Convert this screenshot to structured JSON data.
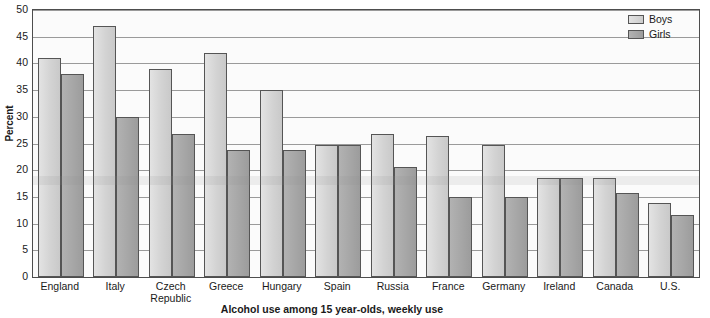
{
  "chart_data": {
    "type": "bar",
    "title": "",
    "xlabel": "Alcohol use among 15 year-olds, weekly use",
    "ylabel": "Percent",
    "ylim": [
      0,
      50
    ],
    "yticks": [
      0,
      5,
      10,
      15,
      20,
      25,
      30,
      35,
      40,
      45,
      50
    ],
    "ytick_labels": [
      "0",
      "5",
      "10",
      "15",
      "20",
      "25",
      "30",
      "35",
      "40",
      "45",
      "50"
    ],
    "grid": true,
    "legend_position": "top-right",
    "categories": [
      "England",
      "Italy",
      "Czech\nRepublic",
      "Greece",
      "Hungary",
      "Spain",
      "Russia",
      "France",
      "Germany",
      "Ireland",
      "Canada",
      "U.S."
    ],
    "series": [
      {
        "name": "Boys",
        "color": "#d6d6d6",
        "values": [
          41,
          47,
          39,
          42,
          35,
          24.7,
          26.7,
          26.5,
          24.7,
          18.6,
          18.6,
          13.8
        ]
      },
      {
        "name": "Girls",
        "color": "#a8a8a8",
        "values": [
          38,
          30,
          26.8,
          23.8,
          23.7,
          24.7,
          20.6,
          15,
          14.9,
          18.6,
          15.8,
          11.7
        ]
      }
    ]
  },
  "legend": {
    "items": [
      {
        "label": "Boys",
        "swatch": "boys"
      },
      {
        "label": "Girls",
        "swatch": "girls"
      }
    ]
  },
  "axes": {
    "y_title": "Percent",
    "x_title": "Alcohol use among 15 year-olds, weekly use"
  }
}
